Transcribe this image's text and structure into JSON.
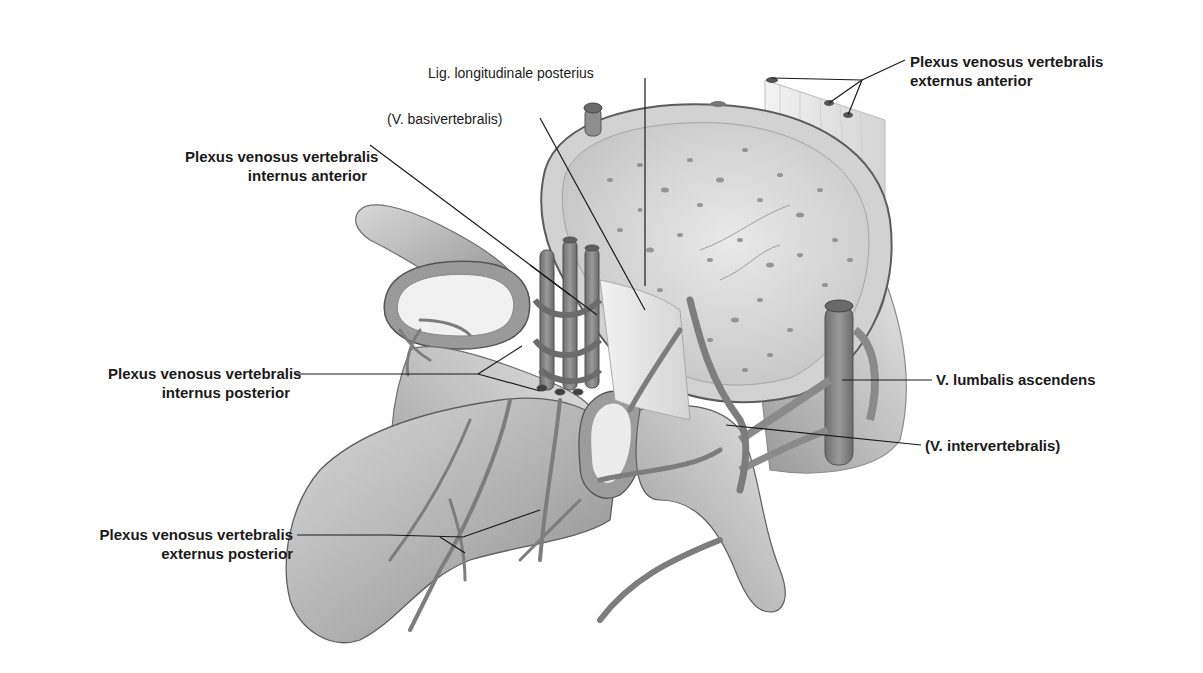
{
  "figure": {
    "type": "anatomical-illustration",
    "colors": {
      "background": "#ffffff",
      "bone_light": "#e6e6e6",
      "bone_mid": "#bdbdbd",
      "bone_dark": "#7a7a7a",
      "vein": "#8c8c8c",
      "vein_dark": "#5a5a5a",
      "leader_line": "#1a1a1a",
      "text": "#1a1a1a"
    }
  },
  "labels": {
    "plexus_ext_ant": {
      "line1": "Plexus venosus vertebralis",
      "line2": "externus anterior"
    },
    "lig_long_post": {
      "text": "Lig. longitudinale posterius"
    },
    "v_basivertebralis": {
      "text": "(V. basivertebralis)"
    },
    "plexus_int_ant": {
      "line1": "Plexus venosus vertebralis",
      "line2": "internus anterior"
    },
    "plexus_int_post": {
      "line1": "Plexus venosus vertebralis",
      "line2": "internus posterior"
    },
    "v_lumbalis_asc": {
      "text": "V. lumbalis ascendens"
    },
    "v_intervertebralis": {
      "text": "(V. intervertebralis)"
    },
    "plexus_ext_post": {
      "line1": "Plexus venosus vertebralis",
      "line2": "externus posterior"
    }
  }
}
